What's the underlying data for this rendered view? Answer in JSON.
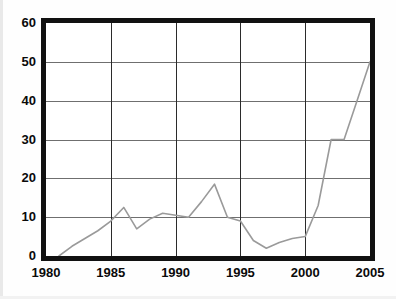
{
  "chart_data": {
    "type": "line",
    "title": "",
    "subtitle": "",
    "xlabel": "",
    "ylabel": "",
    "xlim": [
      1980,
      2005
    ],
    "ylim": [
      0,
      60
    ],
    "grid": true,
    "legend": null,
    "legend_position": "none",
    "xticks": [
      1980,
      1985,
      1990,
      1995,
      2000,
      2005
    ],
    "xtick_labels": [
      "1980",
      "1985",
      "1990",
      "1995",
      "2000",
      "2005"
    ],
    "yticks": [
      0,
      10,
      20,
      30,
      40,
      50,
      60
    ],
    "ytick_labels": [
      "0",
      "10",
      "20",
      "30",
      "40",
      "50",
      "60"
    ],
    "series": [
      {
        "name": "series-1",
        "color": "#9a9a9a",
        "x": [
          1981,
          1982,
          1983,
          1984,
          1985,
          1986,
          1987,
          1988,
          1989,
          1990,
          1991,
          1992,
          1993,
          1994,
          1995,
          1996,
          1997,
          1998,
          1999,
          2000,
          2001,
          2002,
          2003,
          2004,
          2005
        ],
        "values": [
          0,
          2.5,
          4.5,
          6.5,
          9,
          12.5,
          7,
          9.5,
          11,
          10.5,
          10,
          14,
          18.5,
          10,
          9,
          4,
          2,
          3.5,
          4.5,
          5,
          13,
          30,
          30,
          40,
          50
        ]
      }
    ]
  },
  "axes": {
    "y_axis": {
      "name": "y-axis",
      "ticks": [
        "60",
        "50",
        "40",
        "30",
        "20",
        "10",
        "0"
      ]
    },
    "x_axis": {
      "name": "x-axis",
      "ticks": [
        "1980",
        "1985",
        "1990",
        "1995",
        "2000",
        "2005"
      ]
    }
  },
  "style": {
    "frame_color": "#111111",
    "grid_horizontal_color": "#6f6f6f",
    "grid_vertical_color": "#2b2b2b",
    "line_color": "#9a9a9a",
    "background": "#ffffff",
    "text_color": "#0a0a0a"
  }
}
